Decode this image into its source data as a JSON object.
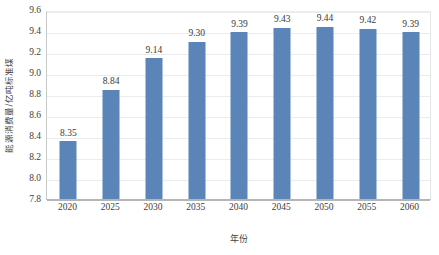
{
  "chart_data": {
    "type": "bar",
    "title": "",
    "subtitle": "",
    "xlabel": "年份",
    "ylabel": "能源消费量/亿吨标准煤",
    "categories": [
      "2020",
      "2025",
      "2030",
      "2035",
      "2040",
      "2045",
      "2050",
      "2055",
      "2060"
    ],
    "values": [
      8.35,
      8.84,
      9.14,
      9.3,
      9.39,
      9.43,
      9.44,
      9.42,
      9.39
    ],
    "data_labels": [
      "8.35",
      "8.84",
      "9.14",
      "9.30",
      "9.39",
      "9.43",
      "9.44",
      "9.42",
      "9.39"
    ],
    "ylim": [
      7.8,
      9.6
    ],
    "ytick_step": 0.2,
    "ytick_labels": [
      "9.6",
      "9.4",
      "9.2",
      "9.0",
      "8.8",
      "8.6",
      "8.4",
      "8.2",
      "8.0",
      "7.8"
    ],
    "ytick_values": [
      9.6,
      9.4,
      9.2,
      9.0,
      8.8,
      8.6,
      8.4,
      8.2,
      8.0,
      7.8
    ],
    "grid": {
      "horizontal": true,
      "vertical": false
    },
    "legend": {
      "visible": false,
      "position": "none"
    },
    "series": [
      {
        "name": "能源消费量",
        "color": "#5b85b8",
        "values": [
          8.35,
          8.84,
          9.14,
          9.3,
          9.39,
          9.43,
          9.44,
          9.42,
          9.39
        ]
      }
    ],
    "colors": {
      "bar": "#5b85b8",
      "gridline": "#e9edf2",
      "axis": "#b5b5b5",
      "text": "#3a3a3a",
      "background": "#ffffff"
    }
  }
}
